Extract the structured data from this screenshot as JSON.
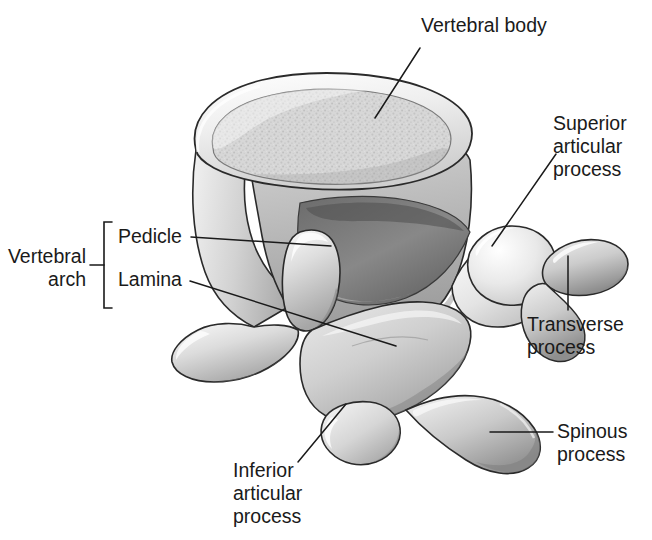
{
  "figure": {
    "subject": "vertebra",
    "style": "grayscale medical illustration",
    "background_color": "#ffffff",
    "line_color": "#1a1a1a",
    "text_color": "#1a1a1a",
    "bone_fill_light": "#e2e2e2",
    "bone_fill_mid": "#c9c9c9",
    "bone_fill_dark": "#8f8f8f",
    "bone_fill_shadow": "#6b6b6b",
    "cartilage_fill": "#d9d9d9"
  },
  "labels": {
    "vertebral_body": "Vertebral body",
    "superior_articular_process": "Superior\narticular\nprocess",
    "transverse_process": "Transverse\nprocess",
    "spinous_process": "Spinous\nprocess",
    "inferior_articular_process": "Inferior\narticular\nprocess",
    "pedicle": "Pedicle",
    "lamina": "Lamina",
    "vertebral_arch": "Vertebral\narch"
  },
  "annotations": [
    {
      "id": "vertebral-body",
      "label": "Vertebral body",
      "leader": "line",
      "anchor_x": 375,
      "anchor_y": 118
    },
    {
      "id": "superior-articular",
      "label": "Superior articular process",
      "leader": "line",
      "anchor_x": 492,
      "anchor_y": 245
    },
    {
      "id": "transverse",
      "label": "Transverse process",
      "leader": "vertical",
      "anchor_x": 568,
      "anchor_y": 255
    },
    {
      "id": "spinous",
      "label": "Spinous process",
      "leader": "horizontal",
      "anchor_x": 490,
      "anchor_y": 432
    },
    {
      "id": "inferior-articular",
      "label": "Inferior articular process",
      "leader": "line",
      "anchor_x": 346,
      "anchor_y": 404
    },
    {
      "id": "pedicle",
      "label": "Pedicle",
      "leader": "line",
      "anchor_x": 331,
      "anchor_y": 246
    },
    {
      "id": "lamina",
      "label": "Lamina",
      "leader": "line",
      "anchor_x": 396,
      "anchor_y": 346
    },
    {
      "id": "vertebral-arch",
      "label": "Vertebral arch",
      "leader": "bracket",
      "anchor_x": 108,
      "anchor_y": 265
    }
  ]
}
